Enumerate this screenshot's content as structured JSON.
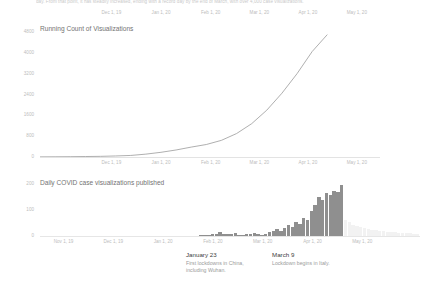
{
  "page": {
    "background_color": "#ffffff",
    "clipped_paragraph": "day. From that point, it has steadily increased, ending with a record day by the end of March, with over 4,000 case visualizations."
  },
  "orphan_axis": {
    "name": "top-partial-axis",
    "ticks": [
      "Dec 1, 19",
      "Jan 1, 20",
      "Feb 1, 20",
      "Mar 1, 20",
      "Apr 1, 20",
      "May 1, 20"
    ],
    "tick_positions_pct": [
      21.0,
      35.6,
      50.2,
      64.5,
      78.8,
      93.2
    ]
  },
  "cumulative_section": {
    "title": "Running Count of Visualizations",
    "axis_color": "#e3e3e3",
    "line_color": "#9a9a9a"
  },
  "daily_section": {
    "title": "Daily COVID case visualizations published",
    "bar_color": "#8f8f8f",
    "ghost_bar_color": "#f2f2f2"
  },
  "annotations": [
    {
      "date": "January 23",
      "text": "First lockdowns in China, including Wuhan.",
      "left_px": 186
    },
    {
      "date": "March 9",
      "text": "Lockdown begins in Italy.",
      "left_px": 272
    }
  ],
  "chart_data": [
    {
      "type": "line",
      "name": "running-count-of-visualizations",
      "title": "Running Count of Visualizations",
      "xlabel": "",
      "ylabel": "",
      "grid": false,
      "legend": "none",
      "ylim": [
        0,
        4800
      ],
      "yticks": [
        4800,
        4000,
        3200,
        2400,
        1600,
        800,
        0
      ],
      "ytick_labels": [
        "4800",
        "4000",
        "3200",
        "2400",
        "1600",
        "800",
        "0"
      ],
      "xticks": [
        "Dec 1, 19",
        "Jan 1, 20",
        "Feb 1, 20",
        "Mar 1, 20",
        "Apr 1, 20",
        "May 1, 20"
      ],
      "xtick_positions_pct": [
        21.0,
        35.6,
        50.2,
        64.5,
        78.8,
        93.2
      ],
      "x": [
        "Nov 1, 19",
        "Nov 15, 19",
        "Dec 1, 19",
        "Dec 15, 19",
        "Jan 1, 20",
        "Jan 15, 20",
        "Feb 1, 20",
        "Feb 8, 20",
        "Feb 15, 20",
        "Feb 22, 20",
        "Mar 1, 20",
        "Mar 5, 20",
        "Mar 9, 20",
        "Mar 13, 20",
        "Mar 17, 20",
        "Mar 21, 20",
        "Mar 25, 20",
        "Mar 29, 20",
        "Apr 2, 20",
        "Apr 6, 20"
      ],
      "values": [
        5,
        8,
        12,
        18,
        25,
        40,
        60,
        110,
        180,
        270,
        380,
        480,
        640,
        900,
        1280,
        1800,
        2450,
        3200,
        4050,
        4700
      ]
    },
    {
      "type": "bar",
      "name": "daily-covid-case-visualizations-published",
      "title": "Daily COVID case visualizations published",
      "xlabel": "",
      "ylabel": "",
      "grid": false,
      "legend": "none",
      "ylim": [
        0,
        200
      ],
      "yticks": [
        200,
        100,
        0
      ],
      "ytick_labels": [
        "200",
        "100",
        "0"
      ],
      "xticks": [
        "Nov 1, 19",
        "Dec 1, 19",
        "Jan 1, 20",
        "Feb 1, 20",
        "Mar 1, 20",
        "Apr 1, 20",
        "May 1, 20"
      ],
      "xtick_positions_pct": [
        6.2,
        19.3,
        32.4,
        45.5,
        58.6,
        71.7,
        84.8
      ],
      "categories": [
        "w1",
        "w2",
        "w3",
        "w4",
        "w5",
        "w6",
        "w7",
        "w8",
        "w9",
        "w10",
        "w11",
        "w12",
        "w13",
        "w14",
        "w15",
        "w16",
        "w17",
        "w18",
        "w19",
        "w20",
        "w21",
        "w22",
        "w23",
        "w24",
        "w25",
        "w26",
        "w27",
        "w28",
        "w29",
        "w30",
        "w31",
        "w32",
        "w33",
        "w34",
        "w35",
        "w36",
        "w37",
        "w38",
        "w39",
        "w40",
        "w41",
        "w42",
        "w43",
        "w44",
        "w45",
        "w46",
        "w47",
        "w48",
        "w49",
        "w50",
        "w51",
        "w52",
        "w53",
        "w54",
        "w55",
        "w56",
        "w57",
        "w58",
        "w59",
        "w60",
        "w61",
        "w62",
        "w63",
        "w64",
        "w65",
        "w66",
        "w67",
        "w68",
        "w69",
        "w70",
        "w71",
        "w72",
        "w73",
        "w74",
        "w75",
        "w76",
        "w77",
        "w78",
        "w79",
        "w80"
      ],
      "values": [
        0,
        0,
        0,
        0,
        0,
        0,
        0,
        0,
        0,
        0,
        0,
        0,
        0,
        0,
        0,
        0,
        0,
        0,
        0,
        0,
        0,
        0,
        0,
        0,
        0,
        0,
        0,
        0,
        0,
        0,
        0,
        0,
        0,
        0,
        0,
        0,
        0,
        0,
        0,
        0,
        0,
        1,
        2,
        3,
        4,
        6,
        9,
        14,
        8,
        6,
        7,
        12,
        5,
        4,
        8,
        6,
        10,
        7,
        5,
        9,
        14,
        20,
        26,
        18,
        30,
        42,
        36,
        55,
        48,
        70,
        62,
        95,
        120,
        150,
        140,
        165,
        158,
        172,
        168,
        195
      ],
      "ghost_from_index": 80,
      "ghost_values": [
        60,
        52,
        44,
        38,
        34,
        30,
        27,
        24,
        22,
        20,
        18,
        16,
        15,
        14,
        13,
        12,
        11,
        10,
        9,
        8
      ]
    }
  ]
}
